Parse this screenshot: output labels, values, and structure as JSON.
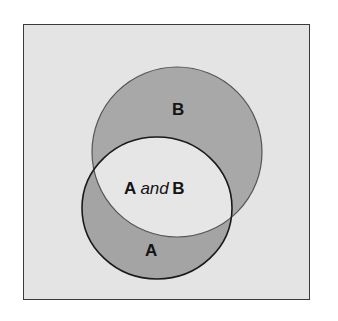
{
  "diagram": {
    "type": "venn",
    "sets": [
      {
        "id": "A",
        "label": "A"
      },
      {
        "id": "B",
        "label": "B"
      }
    ],
    "intersection": {
      "left": "A",
      "conjunction": "and",
      "right": "B"
    },
    "colors": {
      "background": "#e4e4e4",
      "shaded": "#a6a6a6",
      "intersection": "#e6e6e6",
      "outline_a": "#1a1a1a",
      "outline_b": "#555555",
      "frame_border": "#3a3a3a"
    }
  }
}
